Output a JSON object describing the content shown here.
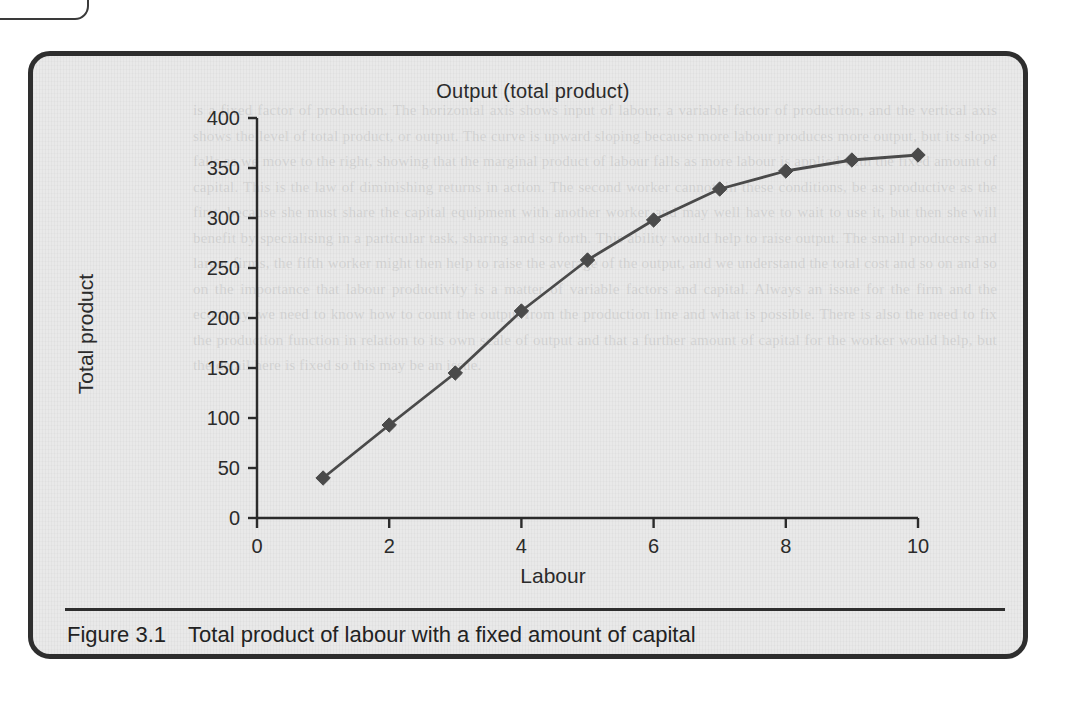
{
  "figure": {
    "number_label": "Figure 3.1",
    "caption": "Total product of labour with a fixed amount of capital"
  },
  "colors": {
    "frame": "#2e2e2e",
    "panel_background": "#e9e9e9",
    "series_line": "#4a4a4a",
    "marker": "#4a4a4a",
    "axis": "#2b2b2b",
    "text": "#2b2b2b"
  },
  "bleed_text": "is a fixed factor of production. The horizontal axis shows input of labour, a variable factor of production, and the vertical axis shows the level of total product, or output. The curve is upward sloping because more labour produces more output, but its slope falls as we move to the right, showing that the marginal product of labour falls as more labour is applied with the fixed amount of capital. This is the law of diminishing returns in action. The second worker cannot, in these conditions, be as productive as the first, because she must share the capital equipment with another worker and may well have to wait to use it, but then she will benefit by specialising in a particular task, sharing and so forth. This ability would help to raise output. The small producers and larger firms, the fifth worker might then help to raise the average of the output, and we understand the total cost and so on and so on the importance that labour productivity is a matter of variable factors and capital. Always an issue for the firm and the economy, we need to know how to count the output from the production line and what is possible. There is also the need to fix the production function in relation to its own scale of output and that a further amount of capital for the worker would help, but the detail here is fixed so this may be an issue.",
  "chart_data": {
    "type": "line",
    "title": "Output (total product)",
    "xlabel": "Labour",
    "ylabel": "Total product",
    "x": [
      1,
      2,
      3,
      4,
      5,
      6,
      7,
      8,
      9,
      10
    ],
    "values": [
      40,
      93,
      145,
      207,
      258,
      298,
      329,
      347,
      358,
      363
    ],
    "series": [
      {
        "name": "Total product",
        "values": [
          40,
          93,
          145,
          207,
          258,
          298,
          329,
          347,
          358,
          363
        ]
      }
    ],
    "xlim": [
      0,
      10
    ],
    "ylim": [
      0,
      400
    ],
    "xticks": [
      0,
      2,
      4,
      6,
      8,
      10
    ],
    "yticks": [
      0,
      50,
      100,
      150,
      200,
      250,
      300,
      350,
      400
    ],
    "xtick_labels": [
      "0",
      "2",
      "4",
      "6",
      "8",
      "10"
    ],
    "ytick_labels": [
      "0",
      "50",
      "100",
      "150",
      "200",
      "250",
      "300",
      "350",
      "400"
    ],
    "grid": false,
    "legend": "none",
    "marker": "diamond"
  }
}
